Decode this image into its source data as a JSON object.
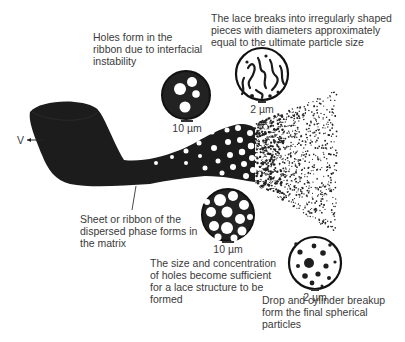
{
  "diagram": {
    "type": "process-illustration",
    "velocity_label": "V",
    "stages": [
      {
        "id": "ribbon",
        "caption": "Sheet or ribbon of the\ndispersed phase forms in\nthe matrix"
      },
      {
        "id": "holes",
        "caption": "Holes form in the\nribbon due to interfacial\ninstability",
        "scale": "10 µm"
      },
      {
        "id": "lace",
        "caption": "The size and concentration\nof holes become sufficient\nfor a lace structure to be\nformed",
        "scale": "10 µm"
      },
      {
        "id": "breakup",
        "caption": "The lace breaks into irregularly shaped\npieces with diameters approximately\nequal to the ultimate particle size",
        "scale": "2 µm"
      },
      {
        "id": "spheres",
        "caption": "Drop and cylinder breakup\nform the final spherical\nparticles",
        "scale": "2 µm"
      }
    ]
  },
  "colors": {
    "ink": "#1a1a1a",
    "text": "#3a3a3a",
    "background": "#ffffff"
  }
}
